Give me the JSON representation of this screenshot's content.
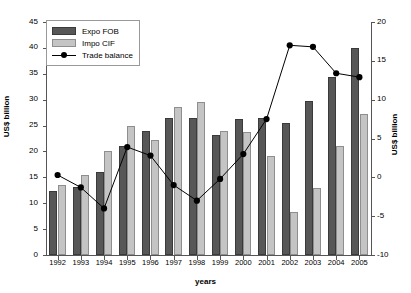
{
  "chart_data": {
    "type": "bar",
    "title": "",
    "xlabel": "years",
    "ylabel": "US$ billion",
    "ylabel_right": "US$ billion",
    "categories": [
      "1992",
      "1993",
      "1994",
      "1995",
      "1996",
      "1997",
      "1998",
      "1999",
      "2000",
      "2001",
      "2002",
      "2003",
      "2004",
      "2005"
    ],
    "ylim": [
      0,
      45
    ],
    "yticks": [
      0,
      5,
      10,
      15,
      20,
      25,
      30,
      35,
      40,
      45
    ],
    "ylim_right": [
      -10,
      20
    ],
    "yticks_right": [
      -10,
      -5,
      0,
      5,
      10,
      15,
      20
    ],
    "grid": false,
    "legend_position": "top-left",
    "series": [
      {
        "name": "Expo FOB",
        "type": "bar",
        "axis": "left",
        "color": "#575757",
        "values": [
          12.4,
          13.2,
          16.0,
          21.0,
          24.0,
          26.4,
          26.4,
          23.2,
          26.2,
          26.4,
          25.5,
          29.8,
          34.4,
          40.0
        ]
      },
      {
        "name": "Impo CIF",
        "type": "bar",
        "axis": "left",
        "color": "#c4c4c4",
        "values": [
          13.6,
          15.4,
          20.1,
          25.0,
          22.3,
          28.5,
          29.5,
          24.0,
          23.8,
          19.2,
          8.3,
          13.0,
          21.0,
          27.2
        ]
      },
      {
        "name": "Trade balance",
        "type": "line",
        "axis": "right",
        "color": "#000000",
        "values": [
          0.3,
          -1.3,
          -4.0,
          3.9,
          2.8,
          -1.0,
          -3.0,
          -0.2,
          3.0,
          7.5,
          17.0,
          16.8,
          13.4,
          12.9
        ]
      }
    ]
  }
}
